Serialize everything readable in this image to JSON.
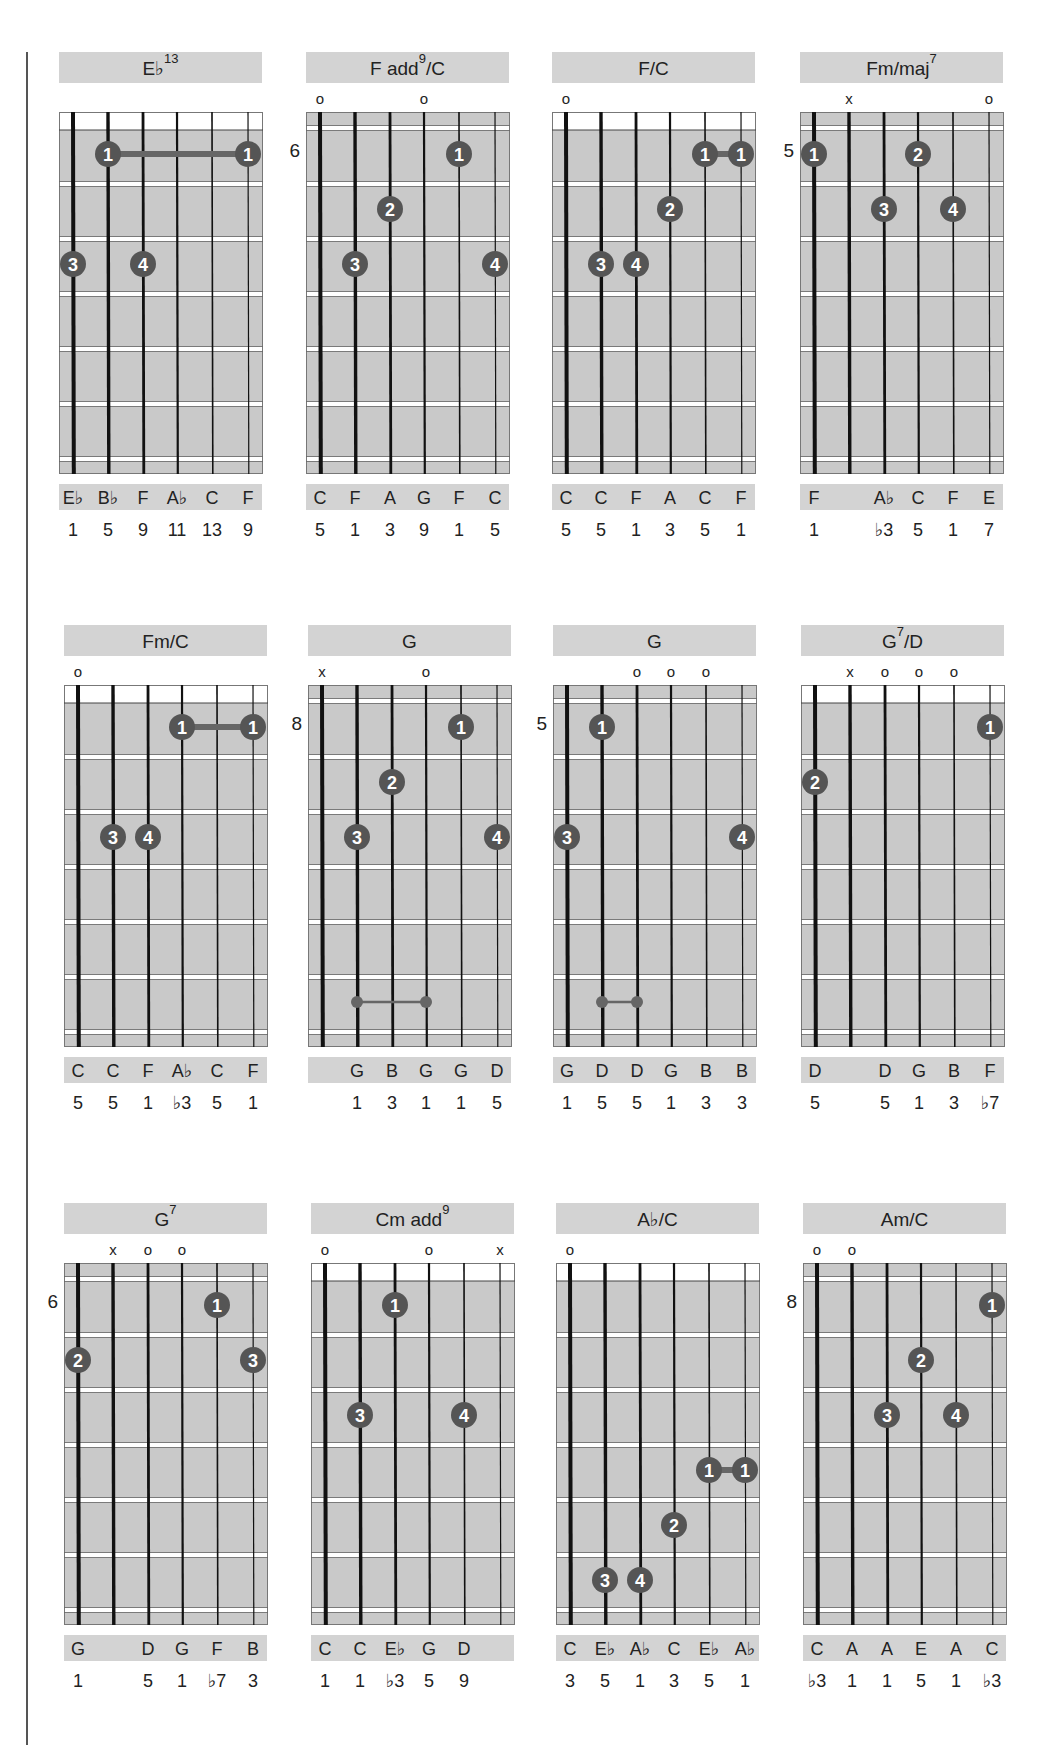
{
  "page": {
    "rows": [
      {
        "chords": [
          {
            "name": "E♭",
            "sup": "13",
            "suffix": "",
            "start_fret": null,
            "markers": [
              "",
              "",
              "",
              "",
              "",
              ""
            ],
            "fingers": [
              {
                "string": 2,
                "fret": 1,
                "finger": "1"
              },
              {
                "string": 6,
                "fret": 1,
                "finger": "1"
              },
              {
                "string": 1,
                "fret": 3,
                "finger": "3"
              },
              {
                "string": 3,
                "fret": 3,
                "finger": "4"
              }
            ],
            "barres": [
              {
                "fret": 1,
                "from": 2,
                "to": 6,
                "type": "finger"
              }
            ],
            "notes": [
              "E♭",
              "B♭",
              "F",
              "A♭",
              "C",
              "F"
            ],
            "intervals": [
              "1",
              "5",
              "9",
              "11",
              "13",
              "9"
            ]
          },
          {
            "name": "F add",
            "sup": "9",
            "suffix": "/C",
            "start_fret": "6",
            "markers": [
              "o",
              "",
              "",
              "o",
              "",
              ""
            ],
            "fingers": [
              {
                "string": 5,
                "fret": 1,
                "finger": "1"
              },
              {
                "string": 3,
                "fret": 2,
                "finger": "2"
              },
              {
                "string": 2,
                "fret": 3,
                "finger": "3"
              },
              {
                "string": 6,
                "fret": 3,
                "finger": "4"
              }
            ],
            "barres": [],
            "notes": [
              "C",
              "F",
              "A",
              "G",
              "F",
              "C"
            ],
            "intervals": [
              "5",
              "1",
              "3",
              "9",
              "1",
              "5"
            ]
          },
          {
            "name": "F/C",
            "sup": "",
            "suffix": "",
            "start_fret": null,
            "markers": [
              "o",
              "",
              "",
              "",
              "",
              ""
            ],
            "fingers": [
              {
                "string": 5,
                "fret": 1,
                "finger": "1"
              },
              {
                "string": 6,
                "fret": 1,
                "finger": "1"
              },
              {
                "string": 4,
                "fret": 2,
                "finger": "2"
              },
              {
                "string": 2,
                "fret": 3,
                "finger": "3"
              },
              {
                "string": 3,
                "fret": 3,
                "finger": "4"
              }
            ],
            "barres": [
              {
                "fret": 1,
                "from": 5,
                "to": 6,
                "type": "finger"
              }
            ],
            "notes": [
              "C",
              "C",
              "F",
              "A",
              "C",
              "F"
            ],
            "intervals": [
              "5",
              "5",
              "1",
              "3",
              "5",
              "1"
            ]
          },
          {
            "name": "Fm/maj",
            "sup": "7",
            "suffix": "",
            "start_fret": "5",
            "markers": [
              "",
              "x",
              "",
              "",
              "",
              "o"
            ],
            "fingers": [
              {
                "string": 1,
                "fret": 1,
                "finger": "1"
              },
              {
                "string": 4,
                "fret": 1,
                "finger": "2"
              },
              {
                "string": 3,
                "fret": 2,
                "finger": "3"
              },
              {
                "string": 5,
                "fret": 2,
                "finger": "4"
              }
            ],
            "barres": [],
            "notes": [
              "F",
              "",
              "A♭",
              "C",
              "F",
              "E"
            ],
            "intervals": [
              "1",
              "",
              "♭3",
              "5",
              "1",
              "7"
            ]
          }
        ]
      },
      {
        "chords": [
          {
            "name": "Fm/C",
            "sup": "",
            "suffix": "",
            "start_fret": null,
            "markers": [
              "o",
              "",
              "",
              "",
              "",
              ""
            ],
            "fingers": [
              {
                "string": 4,
                "fret": 1,
                "finger": "1"
              },
              {
                "string": 6,
                "fret": 1,
                "finger": "1"
              },
              {
                "string": 2,
                "fret": 3,
                "finger": "3"
              },
              {
                "string": 3,
                "fret": 3,
                "finger": "4"
              }
            ],
            "barres": [
              {
                "fret": 1,
                "from": 4,
                "to": 6,
                "type": "finger"
              }
            ],
            "notes": [
              "C",
              "C",
              "F",
              "A♭",
              "C",
              "F"
            ],
            "intervals": [
              "5",
              "5",
              "1",
              "♭3",
              "5",
              "1"
            ]
          },
          {
            "name": "G",
            "sup": "",
            "suffix": "",
            "start_fret": "8",
            "markers": [
              "x",
              "",
              "",
              "o",
              "",
              ""
            ],
            "fingers": [
              {
                "string": 5,
                "fret": 1,
                "finger": "1"
              },
              {
                "string": 3,
                "fret": 2,
                "finger": "2"
              },
              {
                "string": 2,
                "fret": 3,
                "finger": "3"
              },
              {
                "string": 6,
                "fret": 3,
                "finger": "4"
              }
            ],
            "barres": [
              {
                "fret": 6,
                "from": 2,
                "to": 4,
                "type": "small"
              }
            ],
            "notes": [
              "",
              "G",
              "B",
              "G",
              "G",
              "D"
            ],
            "intervals": [
              "",
              "1",
              "3",
              "1",
              "1",
              "5"
            ]
          },
          {
            "name": "G",
            "sup": "",
            "suffix": "",
            "start_fret": "5",
            "markers": [
              "",
              "",
              "o",
              "o",
              "o",
              ""
            ],
            "fingers": [
              {
                "string": 2,
                "fret": 1,
                "finger": "1"
              },
              {
                "string": 1,
                "fret": 3,
                "finger": "3"
              },
              {
                "string": 6,
                "fret": 3,
                "finger": "4"
              }
            ],
            "barres": [
              {
                "fret": 6,
                "from": 2,
                "to": 3,
                "type": "small"
              }
            ],
            "notes": [
              "G",
              "D",
              "D",
              "G",
              "B",
              "B"
            ],
            "intervals": [
              "1",
              "5",
              "5",
              "1",
              "3",
              "3"
            ]
          },
          {
            "name": "G",
            "sup": "7",
            "suffix": "/D",
            "start_fret": null,
            "markers": [
              "",
              "x",
              "o",
              "o",
              "o",
              ""
            ],
            "fingers": [
              {
                "string": 6,
                "fret": 1,
                "finger": "1"
              },
              {
                "string": 1,
                "fret": 2,
                "finger": "2"
              }
            ],
            "barres": [],
            "notes": [
              "D",
              "",
              "D",
              "G",
              "B",
              "F"
            ],
            "intervals": [
              "5",
              "",
              "5",
              "1",
              "3",
              "♭7"
            ]
          }
        ]
      },
      {
        "chords": [
          {
            "name": "G",
            "sup": "7",
            "suffix": "",
            "start_fret": "6",
            "markers": [
              "",
              "x",
              "o",
              "o",
              "",
              ""
            ],
            "fingers": [
              {
                "string": 5,
                "fret": 1,
                "finger": "1"
              },
              {
                "string": 1,
                "fret": 2,
                "finger": "2"
              },
              {
                "string": 6,
                "fret": 2,
                "finger": "3"
              }
            ],
            "barres": [],
            "notes": [
              "G",
              "",
              "D",
              "G",
              "F",
              "B"
            ],
            "intervals": [
              "1",
              "",
              "5",
              "1",
              "♭7",
              "3"
            ]
          },
          {
            "name": "Cm add",
            "sup": "9",
            "suffix": "",
            "start_fret": null,
            "markers": [
              "o",
              "",
              "",
              "o",
              "",
              "x"
            ],
            "fingers": [
              {
                "string": 3,
                "fret": 1,
                "finger": "1"
              },
              {
                "string": 2,
                "fret": 3,
                "finger": "3"
              },
              {
                "string": 5,
                "fret": 3,
                "finger": "4"
              }
            ],
            "barres": [],
            "notes": [
              "C",
              "C",
              "E♭",
              "G",
              "D",
              ""
            ],
            "intervals": [
              "1",
              "1",
              "♭3",
              "5",
              "9",
              ""
            ]
          },
          {
            "name": "A♭/C",
            "sup": "",
            "suffix": "",
            "start_fret": null,
            "markers": [
              "o",
              "",
              "",
              "",
              "",
              ""
            ],
            "fingers": [
              {
                "string": 5,
                "fret": 4,
                "finger": "1"
              },
              {
                "string": 6,
                "fret": 4,
                "finger": "1"
              },
              {
                "string": 4,
                "fret": 5,
                "finger": "2"
              },
              {
                "string": 2,
                "fret": 6,
                "finger": "3"
              },
              {
                "string": 3,
                "fret": 6,
                "finger": "4"
              }
            ],
            "barres": [
              {
                "fret": 4,
                "from": 5,
                "to": 6,
                "type": "finger"
              }
            ],
            "notes": [
              "C",
              "E♭",
              "A♭",
              "C",
              "E♭",
              "A♭"
            ],
            "intervals": [
              "3",
              "5",
              "1",
              "3",
              "5",
              "1"
            ]
          },
          {
            "name": "Am/C",
            "sup": "",
            "suffix": "",
            "start_fret": "8",
            "markers": [
              "o",
              "o",
              "",
              "",
              "",
              ""
            ],
            "fingers": [
              {
                "string": 6,
                "fret": 1,
                "finger": "1"
              },
              {
                "string": 4,
                "fret": 2,
                "finger": "2"
              },
              {
                "string": 3,
                "fret": 3,
                "finger": "3"
              },
              {
                "string": 5,
                "fret": 3,
                "finger": "4"
              }
            ],
            "barres": [],
            "notes": [
              "C",
              "A",
              "A",
              "E",
              "A",
              "C"
            ],
            "intervals": [
              "♭3",
              "1",
              "1",
              "5",
              "1",
              "♭3"
            ]
          }
        ]
      }
    ]
  },
  "colors": {
    "board": "#c9c9c9",
    "title_bar": "#d3d3d3",
    "dot": "#555555",
    "string": "#111111"
  }
}
